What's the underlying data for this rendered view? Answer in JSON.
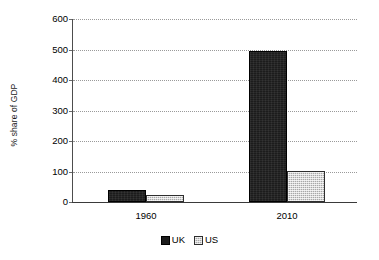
{
  "chart_data": {
    "type": "bar",
    "title": "",
    "subtitle": "",
    "xlabel": "",
    "ylabel": "% share of GDP",
    "categories": [
      "1960",
      "2010"
    ],
    "series": [
      {
        "name": "UK",
        "values": [
          40,
          495
        ],
        "color": "#1c1c1c"
      },
      {
        "name": "US",
        "values": [
          23,
          102
        ],
        "color": "#a8a8a8"
      }
    ],
    "ylim": [
      0,
      600
    ],
    "ytick_step": 100,
    "yticks": [
      "600",
      "500",
      "400",
      "300",
      "200",
      "100",
      "0"
    ],
    "grid": "horizontal-dotted",
    "legend_position": "bottom",
    "annotations": []
  },
  "legend": {
    "entries": [
      {
        "label": "UK",
        "swatch": "uk-swatch"
      },
      {
        "label": "US",
        "swatch": "us-swatch"
      }
    ]
  }
}
